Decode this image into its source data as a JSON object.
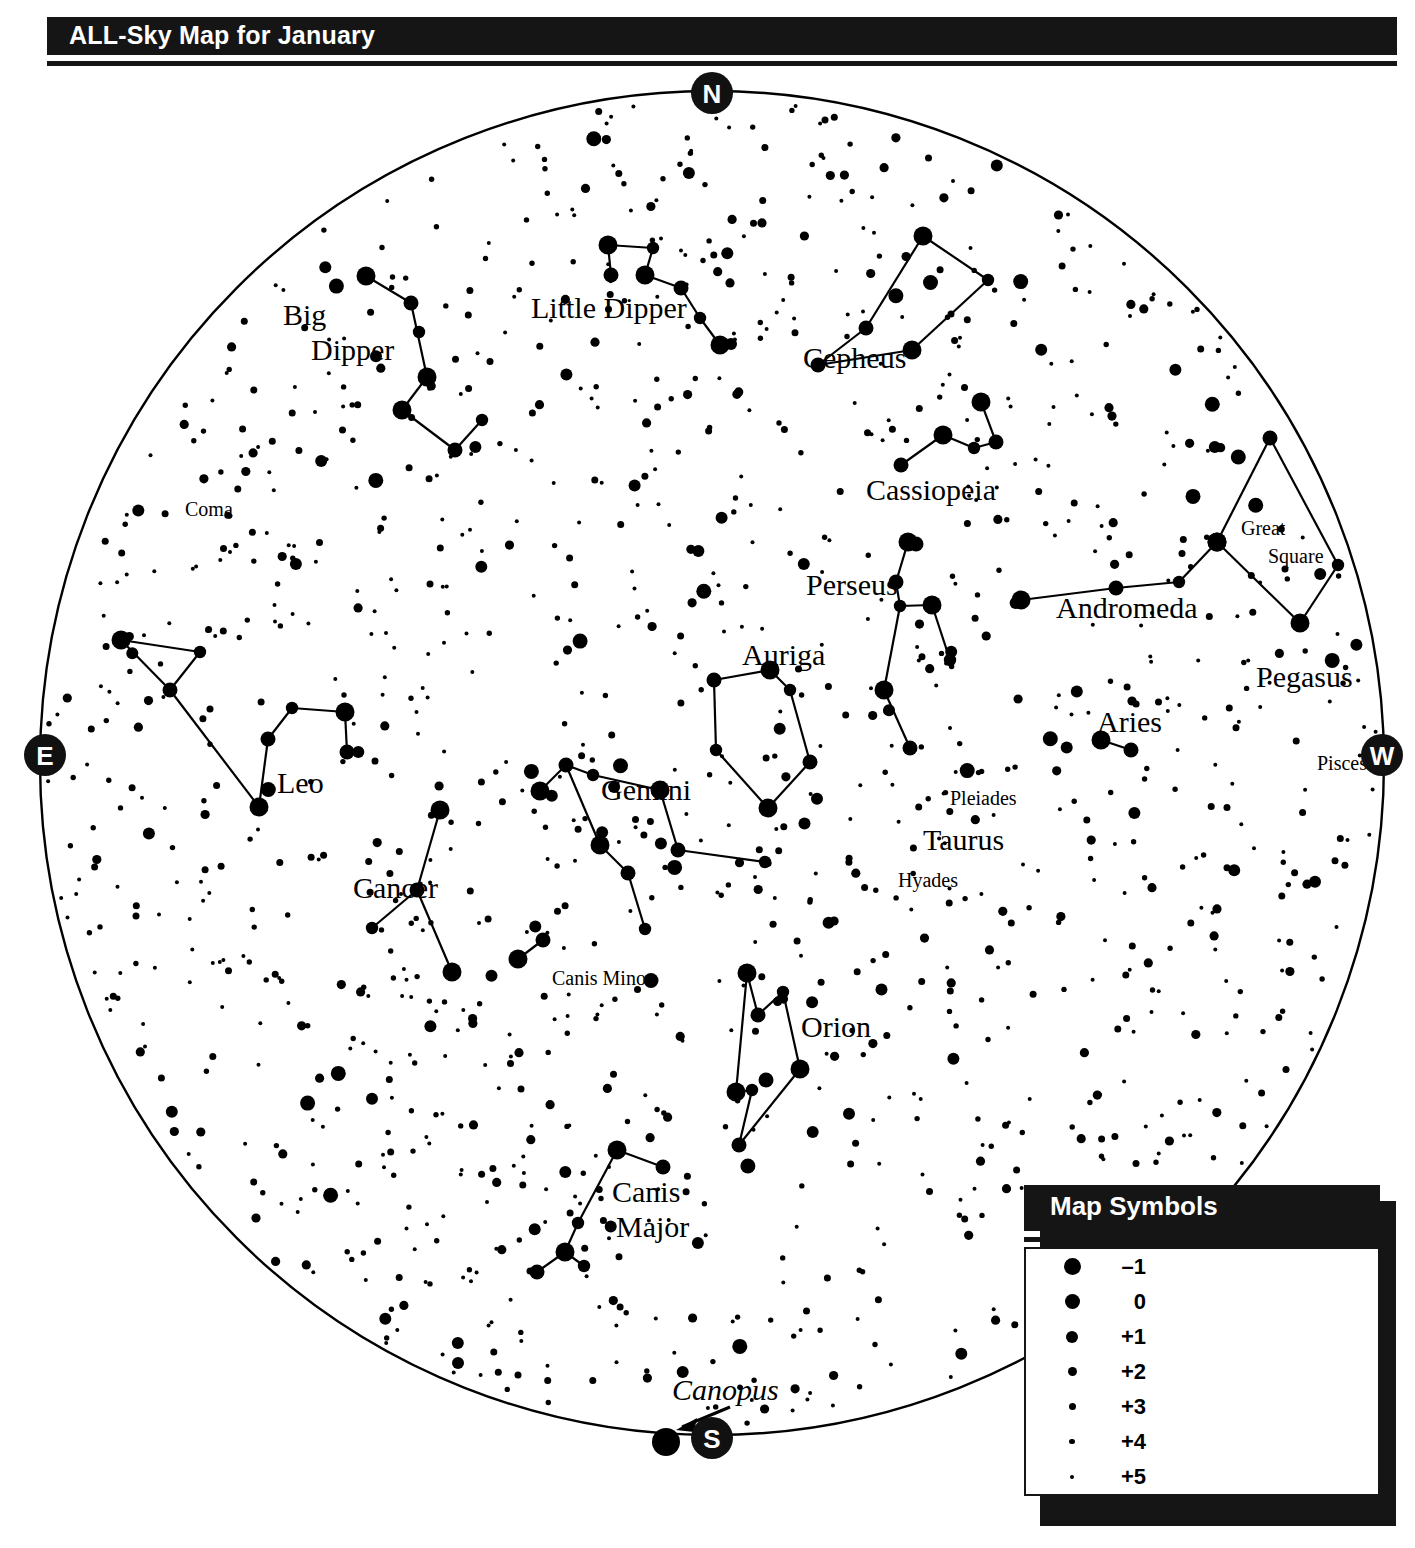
{
  "header": {
    "title": "ALL-Sky Map for January"
  },
  "compass": [
    {
      "name": "north",
      "label": "N",
      "x": 712,
      "y": 33
    },
    {
      "name": "east",
      "label": "E",
      "x": 45,
      "y": 695
    },
    {
      "name": "west",
      "label": "W",
      "x": 1382,
      "y": 695
    },
    {
      "name": "south",
      "label": "S",
      "x": 712,
      "y": 1378
    }
  ],
  "horizon": {
    "cx": 712,
    "cy": 703,
    "r": 672
  },
  "labels": [
    {
      "name": "big-dipper",
      "text": "Big",
      "x": 283,
      "y": 265,
      "size": "lg"
    },
    {
      "name": "big-dipper2",
      "text": "Dipper",
      "x": 311,
      "y": 300,
      "size": "lg"
    },
    {
      "name": "little-dipper",
      "text": "Little Dipper",
      "x": 531,
      "y": 258,
      "size": "lg"
    },
    {
      "name": "cepheus",
      "text": "Cepheus",
      "x": 803,
      "y": 308,
      "size": "lg"
    },
    {
      "name": "cassiopeia",
      "text": "Cassiopeia",
      "x": 866,
      "y": 440,
      "size": "lg"
    },
    {
      "name": "coma",
      "text": "Coma",
      "x": 185,
      "y": 456,
      "size": "sm"
    },
    {
      "name": "perseus",
      "text": "Perseus",
      "x": 806,
      "y": 535,
      "size": "lg"
    },
    {
      "name": "great-square",
      "text": "Great",
      "x": 1241,
      "y": 475,
      "size": "sm"
    },
    {
      "name": "great-square2",
      "text": "Square",
      "x": 1268,
      "y": 503,
      "size": "sm"
    },
    {
      "name": "andromeda",
      "text": "Andromeda",
      "x": 1056,
      "y": 558,
      "size": "lg"
    },
    {
      "name": "pegasus",
      "text": "Pegasus",
      "x": 1256,
      "y": 627,
      "size": "lg"
    },
    {
      "name": "auriga",
      "text": "Auriga",
      "x": 742,
      "y": 605,
      "size": "lg"
    },
    {
      "name": "aries",
      "text": "Aries",
      "x": 1097,
      "y": 672,
      "size": "lg"
    },
    {
      "name": "pisces",
      "text": "Pisces",
      "x": 1317,
      "y": 710,
      "size": "sm"
    },
    {
      "name": "leo",
      "text": "Leo",
      "x": 277,
      "y": 733,
      "size": "lg"
    },
    {
      "name": "gemini",
      "text": "Gemini",
      "x": 601,
      "y": 740,
      "size": "lg"
    },
    {
      "name": "pleiades",
      "text": "Pleiades",
      "x": 950,
      "y": 745,
      "size": "sm"
    },
    {
      "name": "taurus",
      "text": "Taurus",
      "x": 923,
      "y": 790,
      "size": "lg"
    },
    {
      "name": "hyades",
      "text": "Hyades",
      "x": 898,
      "y": 827,
      "size": "sm"
    },
    {
      "name": "cancer",
      "text": "Cancer",
      "x": 353,
      "y": 838,
      "size": "lg"
    },
    {
      "name": "canis-minor",
      "text": "Canis Minor",
      "x": 552,
      "y": 925,
      "size": "sm"
    },
    {
      "name": "orion",
      "text": "Orion",
      "x": 801,
      "y": 977,
      "size": "lg"
    },
    {
      "name": "canis-major",
      "text": "Canis",
      "x": 612,
      "y": 1142,
      "size": "lg"
    },
    {
      "name": "canis-major2",
      "text": "Major",
      "x": 616,
      "y": 1177,
      "size": "lg"
    }
  ],
  "canopus": {
    "label": "Canopus",
    "x": 672,
    "y": 1340
  },
  "legend": {
    "title": "Map Symbols",
    "rows": [
      {
        "magnitude": "–1",
        "size": 17
      },
      {
        "magnitude": "0",
        "size": 15
      },
      {
        "magnitude": "+1",
        "size": 12
      },
      {
        "magnitude": "+2",
        "size": 9
      },
      {
        "magnitude": "+3",
        "size": 7
      },
      {
        "magnitude": "+4",
        "size": 5.5
      },
      {
        "magnitude": "+5",
        "size": 4
      }
    ]
  },
  "chart_data": {
    "type": "scatter",
    "title": "ALL-Sky Map for January",
    "constellations": [
      {
        "name": "Big Dipper",
        "stars": [
          [
            366,
            216
          ],
          [
            411,
            243
          ],
          [
            419,
            272
          ],
          [
            402,
            350
          ],
          [
            455,
            390
          ],
          [
            482,
            360
          ],
          [
            427,
            317
          ]
        ],
        "lines": [
          [
            0,
            1
          ],
          [
            1,
            6
          ],
          [
            6,
            3
          ],
          [
            3,
            4
          ],
          [
            4,
            5
          ]
        ]
      },
      {
        "name": "Little Dipper",
        "stars": [
          [
            608,
            185
          ],
          [
            611,
            215
          ],
          [
            653,
            188
          ],
          [
            645,
            215
          ],
          [
            681,
            228
          ],
          [
            700,
            258
          ],
          [
            720,
            285
          ]
        ],
        "lines": [
          [
            0,
            1
          ],
          [
            0,
            2
          ],
          [
            2,
            3
          ],
          [
            3,
            4
          ],
          [
            4,
            5
          ],
          [
            5,
            6
          ]
        ]
      },
      {
        "name": "Cepheus",
        "stars": [
          [
            923,
            176
          ],
          [
            866,
            268
          ],
          [
            988,
            220
          ],
          [
            912,
            290
          ],
          [
            818,
            305
          ]
        ],
        "lines": [
          [
            1,
            0
          ],
          [
            0,
            2
          ],
          [
            2,
            3
          ],
          [
            3,
            4
          ],
          [
            4,
            1
          ]
        ]
      },
      {
        "name": "Cassiopeia",
        "stars": [
          [
            981,
            342
          ],
          [
            996,
            382
          ],
          [
            974,
            388
          ],
          [
            943,
            375
          ],
          [
            901,
            405
          ]
        ],
        "lines": [
          [
            0,
            1
          ],
          [
            1,
            2
          ],
          [
            2,
            3
          ],
          [
            3,
            4
          ]
        ]
      },
      {
        "name": "Perseus",
        "stars": [
          [
            908,
            482
          ],
          [
            896,
            522
          ],
          [
            900,
            546
          ],
          [
            884,
            630
          ],
          [
            910,
            688
          ],
          [
            950,
            600
          ],
          [
            932,
            545
          ],
          [
            916,
            484
          ]
        ],
        "lines": [
          [
            7,
            0
          ],
          [
            0,
            1
          ],
          [
            1,
            2
          ],
          [
            2,
            3
          ],
          [
            3,
            4
          ],
          [
            2,
            6
          ],
          [
            6,
            5
          ]
        ]
      },
      {
        "name": "Auriga",
        "stars": [
          [
            770,
            610
          ],
          [
            714,
            620
          ],
          [
            716,
            690
          ],
          [
            768,
            748
          ],
          [
            810,
            702
          ],
          [
            790,
            630
          ]
        ],
        "lines": [
          [
            0,
            1
          ],
          [
            1,
            2
          ],
          [
            2,
            3
          ],
          [
            3,
            4
          ],
          [
            4,
            5
          ],
          [
            5,
            0
          ]
        ]
      },
      {
        "name": "Andromeda",
        "stars": [
          [
            1021,
            540
          ],
          [
            1116,
            528
          ],
          [
            1179,
            522
          ],
          [
            1217,
            482
          ]
        ],
        "lines": [
          [
            0,
            1
          ],
          [
            1,
            2
          ],
          [
            2,
            3
          ]
        ]
      },
      {
        "name": "Pegasus",
        "stars": [
          [
            1217,
            482
          ],
          [
            1270,
            378
          ],
          [
            1338,
            505
          ],
          [
            1300,
            563
          ]
        ],
        "lines": [
          [
            0,
            1
          ],
          [
            1,
            2
          ],
          [
            2,
            3
          ],
          [
            3,
            0
          ]
        ]
      },
      {
        "name": "Aries",
        "stars": [
          [
            1101,
            680
          ],
          [
            1131,
            690
          ]
        ],
        "lines": [
          [
            0,
            1
          ]
        ]
      },
      {
        "name": "Leo",
        "stars": [
          [
            121,
            580
          ],
          [
            170,
            630
          ],
          [
            200,
            592
          ],
          [
            259,
            747
          ],
          [
            268,
            679
          ],
          [
            292,
            648
          ],
          [
            345,
            652
          ],
          [
            347,
            692
          ]
        ],
        "lines": [
          [
            0,
            2
          ],
          [
            2,
            1
          ],
          [
            1,
            0
          ],
          [
            1,
            3
          ],
          [
            3,
            4
          ],
          [
            4,
            5
          ],
          [
            5,
            6
          ],
          [
            6,
            7
          ]
        ]
      },
      {
        "name": "Gemini",
        "stars": [
          [
            540,
            731
          ],
          [
            566,
            705
          ],
          [
            593,
            715
          ],
          [
            660,
            730
          ],
          [
            678,
            790
          ],
          [
            765,
            802
          ],
          [
            600,
            785
          ],
          [
            628,
            813
          ],
          [
            645,
            869
          ]
        ],
        "lines": [
          [
            0,
            1
          ],
          [
            1,
            2
          ],
          [
            2,
            3
          ],
          [
            3,
            4
          ],
          [
            4,
            5
          ],
          [
            1,
            6
          ],
          [
            6,
            7
          ],
          [
            7,
            8
          ]
        ]
      },
      {
        "name": "Cancer",
        "stars": [
          [
            440,
            750
          ],
          [
            417,
            830
          ],
          [
            372,
            868
          ],
          [
            452,
            912
          ]
        ],
        "lines": [
          [
            0,
            1
          ],
          [
            1,
            2
          ],
          [
            1,
            3
          ]
        ]
      },
      {
        "name": "Canis Minor",
        "stars": [
          [
            518,
            899
          ],
          [
            543,
            880
          ]
        ],
        "lines": [
          [
            0,
            1
          ]
        ]
      },
      {
        "name": "Orion",
        "stars": [
          [
            747,
            913
          ],
          [
            758,
            955
          ],
          [
            783,
            932
          ],
          [
            800,
            1009
          ],
          [
            766,
            1020
          ],
          [
            752,
            1030
          ],
          [
            736,
            1032
          ],
          [
            739,
            1085
          ]
        ],
        "lines": [
          [
            0,
            1
          ],
          [
            1,
            2
          ],
          [
            2,
            3
          ],
          [
            0,
            6
          ],
          [
            6,
            5
          ],
          [
            5,
            7
          ],
          [
            7,
            3
          ]
        ]
      },
      {
        "name": "Canis Major",
        "stars": [
          [
            617,
            1090
          ],
          [
            663,
            1107
          ],
          [
            578,
            1163
          ],
          [
            565,
            1192
          ],
          [
            537,
            1212
          ],
          [
            584,
            1206
          ]
        ],
        "lines": [
          [
            0,
            1
          ],
          [
            0,
            2
          ],
          [
            2,
            3
          ],
          [
            3,
            4
          ],
          [
            3,
            5
          ]
        ]
      }
    ]
  }
}
